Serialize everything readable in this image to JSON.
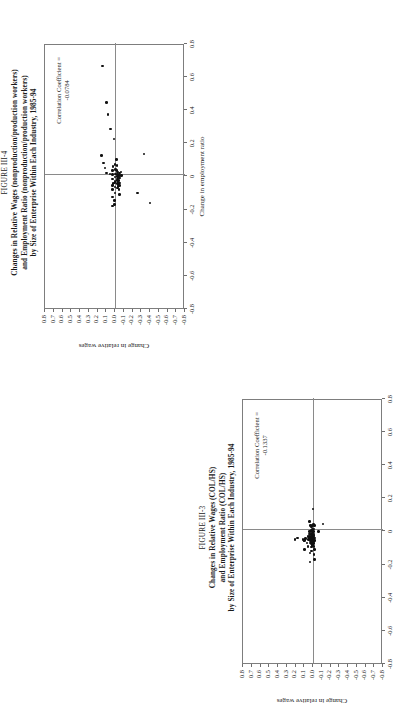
{
  "page": {
    "width": 396,
    "height": 709,
    "orientation": "figures rotated 90 degrees (landscape on portrait page)"
  },
  "figures": [
    {
      "id": "figure-iii-4",
      "fignum": "FIGURE III-4",
      "title_lines": [
        "Changes in Relative Wages (nonproduction/production workers)",
        "and Employment Ratio (nonproduction/production workers)",
        "by Size of Enterprise Within Each Industry, 1985-94"
      ],
      "corr_label": "Correlation Coefficient =",
      "corr_value": "-0.0784",
      "chart_data": {
        "type": "scatter",
        "title": "Changes in Relative Wages (nonproduction/production workers) and Employment Ratio (nonproduction/production workers) by Size of Enterprise Within Each Industry, 1985-94",
        "xlabel": "Change in employment ratio",
        "ylabel": "Change in relative wages",
        "xlim": [
          -0.8,
          0.8
        ],
        "ylim": [
          -0.8,
          0.8
        ],
        "xticks": [
          -0.8,
          -0.6,
          -0.4,
          -0.2,
          0,
          0.2,
          0.4,
          0.6,
          0.8
        ],
        "xticklabels": [
          "-0.8",
          "-0.6",
          "-0.4",
          "-0.2",
          "0",
          "0.2",
          "0.4",
          "0.6",
          "0.8"
        ],
        "yticks": [
          -0.8,
          -0.7,
          -0.6,
          -0.5,
          -0.4,
          -0.3,
          -0.2,
          -0.1,
          0.0,
          0.1,
          0.2,
          0.3,
          0.4,
          0.5,
          0.6,
          0.7,
          0.8
        ],
        "yticklabels": [
          "-0.8",
          "-0.7",
          "-0.6",
          "-0.5",
          "-0.4",
          "-0.3",
          "-0.2",
          "-0.1",
          "0.0",
          "0.1",
          "0.2",
          "0.3",
          "0.4",
          "0.5",
          "0.6",
          "0.7",
          "0.8"
        ],
        "grid": false,
        "legend": false,
        "annotations": [
          {
            "text": "Correlation Coefficient = -0.0784",
            "x": 0.52,
            "y": 0.62
          }
        ],
        "correlation_coefficient": -0.0784,
        "points": [
          [
            0.66,
            0.14
          ],
          [
            0.44,
            0.1
          ],
          [
            0.37,
            0.08
          ],
          [
            0.28,
            0.05
          ],
          [
            0.22,
            0.01
          ],
          [
            0.12,
            0.155
          ],
          [
            0.075,
            0.13
          ],
          [
            0.045,
            0.115
          ],
          [
            0.015,
            0.095
          ],
          [
            0.01,
            0.055
          ],
          [
            0.005,
            0.028
          ],
          [
            0.03,
            0.028
          ],
          [
            0.055,
            0.022
          ],
          [
            -0.02,
            0.028
          ],
          [
            -0.05,
            0.022
          ],
          [
            -0.06,
            0.03
          ],
          [
            -0.085,
            0.026
          ],
          [
            -0.13,
            0.03
          ],
          [
            -0.185,
            0.03
          ],
          [
            0.065,
            0.0
          ],
          [
            0.035,
            -0.003
          ],
          [
            0.01,
            -0.005
          ],
          [
            -0.01,
            0.0
          ],
          [
            -0.035,
            0.0
          ],
          [
            -0.045,
            0.005
          ],
          [
            -0.07,
            0.0
          ],
          [
            -0.105,
            0.0
          ],
          [
            -0.15,
            0.005
          ],
          [
            -0.175,
            0.005
          ],
          [
            0.095,
            -0.018
          ],
          [
            0.06,
            -0.022
          ],
          [
            0.03,
            -0.024
          ],
          [
            0.02,
            -0.03
          ],
          [
            0.005,
            -0.028
          ],
          [
            -0.005,
            -0.03
          ],
          [
            -0.015,
            -0.032
          ],
          [
            -0.02,
            -0.028
          ],
          [
            -0.03,
            -0.03
          ],
          [
            -0.04,
            -0.033
          ],
          [
            -0.05,
            -0.03
          ],
          [
            -0.055,
            -0.035
          ],
          [
            -0.065,
            -0.032
          ],
          [
            -0.075,
            -0.03
          ],
          [
            0.015,
            -0.05
          ],
          [
            0.0,
            -0.052
          ],
          [
            -0.015,
            -0.05
          ],
          [
            -0.03,
            -0.048
          ],
          [
            -0.045,
            -0.05
          ],
          [
            -0.06,
            -0.052
          ],
          [
            -0.085,
            -0.048
          ],
          [
            -0.115,
            -0.05
          ],
          [
            0.02,
            -0.07
          ],
          [
            0.0,
            -0.072
          ],
          [
            -0.105,
            -0.26
          ],
          [
            0.13,
            -0.33
          ],
          [
            -0.165,
            -0.4
          ]
        ]
      }
    },
    {
      "id": "figure-iii-3",
      "fignum": "FIGURE III-3",
      "title_lines": [
        "Changes in Relative Wages (COL/HS)",
        "and Employment Ratio (COL/HS)",
        "by Size of Enterprise Within Each Industry, 1985-94"
      ],
      "corr_label": "Correlation Coefficient =",
      "corr_value": "-0.1337",
      "chart_data": {
        "type": "scatter",
        "title": "Changes in Relative Wages (COL/HS) and Employment Ratio (COL/HS) by Size of Enterprise Within Each Industry, 1985-94",
        "xlabel": "Change in employment ratio",
        "ylabel": "Change in relative wages",
        "xlim": [
          -0.8,
          0.8
        ],
        "ylim": [
          -0.8,
          0.8
        ],
        "xticks": [
          -0.8,
          -0.6,
          -0.4,
          -0.2,
          0,
          0.2,
          0.4,
          0.6,
          0.8
        ],
        "xticklabels": [
          "-0.8",
          "-0.6",
          "-0.4",
          "-0.2",
          "0",
          "0.2",
          "0.4",
          "0.6",
          "0.8"
        ],
        "yticks": [
          -0.8,
          -0.7,
          -0.6,
          -0.5,
          -0.4,
          -0.3,
          -0.2,
          -0.1,
          0.0,
          0.1,
          0.2,
          0.3,
          0.4,
          0.5,
          0.6,
          0.7,
          0.8
        ],
        "yticklabels": [
          "-0.8",
          "-0.7",
          "-0.6",
          "-0.5",
          "-0.4",
          "-0.3",
          "-0.2",
          "-0.1",
          "0.0",
          "0.1",
          "0.2",
          "0.3",
          "0.4",
          "0.5",
          "0.6",
          "0.7",
          "0.8"
        ],
        "grid": false,
        "legend": false,
        "annotations": [
          {
            "text": "Correlation Coefficient = -0.1337",
            "x": 0.52,
            "y": 0.62
          }
        ],
        "correlation_coefficient": -0.1337,
        "points": [
          [
            0.13,
            0.0
          ],
          [
            -0.055,
            0.205
          ],
          [
            -0.045,
            0.175
          ],
          [
            -0.055,
            0.115
          ],
          [
            -0.06,
            0.105
          ],
          [
            -0.06,
            0.098
          ],
          [
            -0.115,
            0.1
          ],
          [
            -0.05,
            0.085
          ],
          [
            -0.075,
            0.068
          ],
          [
            -0.035,
            0.055
          ],
          [
            -0.055,
            0.05
          ],
          [
            -0.095,
            0.058
          ],
          [
            0.055,
            0.038
          ],
          [
            0.03,
            0.03
          ],
          [
            -0.005,
            0.042
          ],
          [
            -0.02,
            0.04
          ],
          [
            -0.035,
            0.042
          ],
          [
            -0.045,
            0.04
          ],
          [
            -0.05,
            0.038
          ],
          [
            -0.055,
            0.042
          ],
          [
            -0.06,
            0.035
          ],
          [
            -0.075,
            0.03
          ],
          [
            -0.135,
            0.035
          ],
          [
            -0.19,
            0.032
          ],
          [
            0.02,
            0.02
          ],
          [
            0.0,
            0.018
          ],
          [
            -0.015,
            0.022
          ],
          [
            -0.025,
            0.02
          ],
          [
            -0.035,
            0.018
          ],
          [
            -0.04,
            0.022
          ],
          [
            -0.045,
            0.015
          ],
          [
            -0.05,
            0.02
          ],
          [
            -0.055,
            0.018
          ],
          [
            -0.06,
            0.022
          ],
          [
            -0.065,
            0.015
          ],
          [
            -0.07,
            0.02
          ],
          [
            -0.08,
            0.018
          ],
          [
            -0.1,
            0.02
          ],
          [
            -0.125,
            0.018
          ],
          [
            0.03,
            0.008
          ],
          [
            0.005,
            0.005
          ],
          [
            -0.01,
            0.008
          ],
          [
            -0.02,
            0.005
          ],
          [
            -0.03,
            0.008
          ],
          [
            -0.04,
            0.006
          ],
          [
            -0.05,
            0.004
          ],
          [
            -0.055,
            0.008
          ],
          [
            -0.06,
            0.002
          ],
          [
            -0.07,
            0.006
          ],
          [
            -0.08,
            0.004
          ],
          [
            -0.09,
            0.006
          ],
          [
            0.035,
            -0.008
          ],
          [
            0.01,
            -0.01
          ],
          [
            -0.005,
            -0.006
          ],
          [
            -0.02,
            -0.01
          ],
          [
            -0.03,
            -0.008
          ],
          [
            -0.04,
            -0.012
          ],
          [
            -0.05,
            -0.008
          ],
          [
            -0.06,
            -0.01
          ],
          [
            -0.07,
            -0.012
          ],
          [
            -0.08,
            -0.008
          ],
          [
            -0.095,
            -0.012
          ],
          [
            -0.115,
            -0.015
          ],
          [
            -0.145,
            -0.012
          ],
          [
            -0.175,
            -0.015
          ],
          [
            0.03,
            -0.02
          ],
          [
            -0.045,
            -0.022
          ],
          [
            -0.06,
            -0.022
          ],
          [
            -0.005,
            -0.06
          ],
          [
            0.04,
            -0.115
          ]
        ]
      }
    }
  ]
}
